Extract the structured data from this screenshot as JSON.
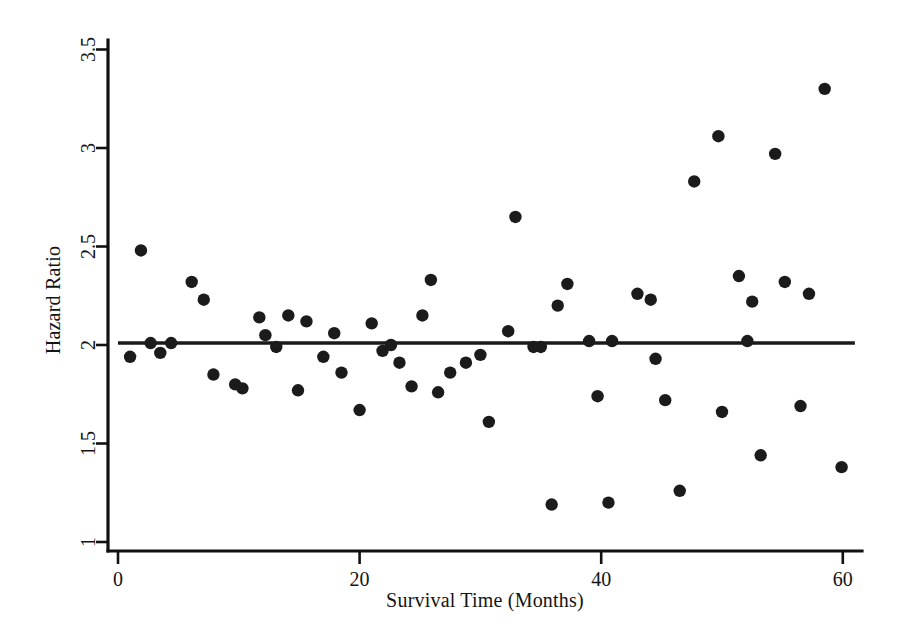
{
  "chart_data": {
    "type": "scatter",
    "title": "",
    "xlabel": "Survival Time (Months)",
    "ylabel": "Hazard Ratio",
    "xlim": [
      0,
      62
    ],
    "ylim": [
      1,
      3.5
    ],
    "xticks": [
      0,
      20,
      40,
      60
    ],
    "xtick_labels": [
      "0",
      "20",
      "40",
      "60"
    ],
    "yticks": [
      1,
      1.5,
      2,
      2.5,
      3,
      3.5
    ],
    "ytick_labels": [
      "1",
      "1.5",
      "2",
      "2.5",
      "3",
      "3.5"
    ],
    "grid": false,
    "legend": null,
    "marker": "filled-circle",
    "marker_color": "#1b1b1b",
    "annotations": [
      {
        "name": "reference-line",
        "type": "horizontal-line",
        "y": 2.01,
        "x_start": 0.0,
        "x_end": 61.0,
        "color": "#1a1a1a"
      }
    ],
    "series": [
      {
        "name": "Hazard ratio estimates",
        "points": [
          [
            1.0,
            1.94
          ],
          [
            1.9,
            2.48
          ],
          [
            2.7,
            2.01
          ],
          [
            3.5,
            1.96
          ],
          [
            4.4,
            2.01
          ],
          [
            6.1,
            2.32
          ],
          [
            7.1,
            2.23
          ],
          [
            7.9,
            1.85
          ],
          [
            9.7,
            1.8
          ],
          [
            10.3,
            1.78
          ],
          [
            11.7,
            2.14
          ],
          [
            12.2,
            2.05
          ],
          [
            13.1,
            1.99
          ],
          [
            14.1,
            2.15
          ],
          [
            14.9,
            1.77
          ],
          [
            15.6,
            2.12
          ],
          [
            17.0,
            1.94
          ],
          [
            17.9,
            2.06
          ],
          [
            18.5,
            1.86
          ],
          [
            20.0,
            1.67
          ],
          [
            21.0,
            2.11
          ],
          [
            21.9,
            1.97
          ],
          [
            22.6,
            2.0
          ],
          [
            23.3,
            1.91
          ],
          [
            24.3,
            1.79
          ],
          [
            25.2,
            2.15
          ],
          [
            25.9,
            2.33
          ],
          [
            26.5,
            1.76
          ],
          [
            27.5,
            1.86
          ],
          [
            28.8,
            1.91
          ],
          [
            30.0,
            1.95
          ],
          [
            30.7,
            1.61
          ],
          [
            32.3,
            2.07
          ],
          [
            32.9,
            2.65
          ],
          [
            34.4,
            1.99
          ],
          [
            35.0,
            1.99
          ],
          [
            35.9,
            1.19
          ],
          [
            36.4,
            2.2
          ],
          [
            37.2,
            2.31
          ],
          [
            39.0,
            2.02
          ],
          [
            39.7,
            1.74
          ],
          [
            40.6,
            1.2
          ],
          [
            40.9,
            2.02
          ],
          [
            43.0,
            2.26
          ],
          [
            44.1,
            2.23
          ],
          [
            44.5,
            1.93
          ],
          [
            45.3,
            1.72
          ],
          [
            46.5,
            1.26
          ],
          [
            47.7,
            2.83
          ],
          [
            49.7,
            3.06
          ],
          [
            50.0,
            1.66
          ],
          [
            51.4,
            2.35
          ],
          [
            52.1,
            2.02
          ],
          [
            52.5,
            2.22
          ],
          [
            53.2,
            1.44
          ],
          [
            54.4,
            2.97
          ],
          [
            55.2,
            2.32
          ],
          [
            56.5,
            1.69
          ],
          [
            57.2,
            2.26
          ],
          [
            58.5,
            3.3
          ],
          [
            59.9,
            1.38
          ]
        ]
      }
    ]
  },
  "axes": {
    "y_axis_name": "hazard-ratio-axis",
    "x_axis_name": "survival-time-axis"
  }
}
